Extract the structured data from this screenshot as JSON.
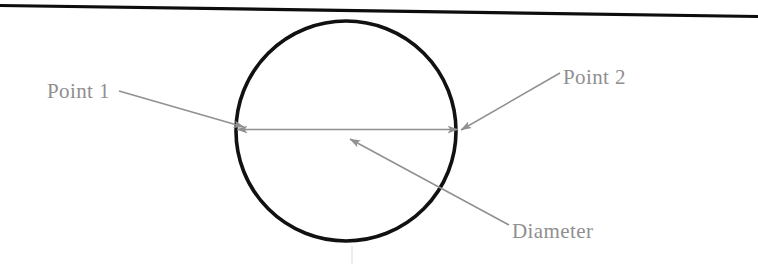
{
  "figure": {
    "kind": "technical-line-drawing",
    "width": 758,
    "height": 264,
    "background_color": "#ffffff"
  },
  "colors": {
    "outline": "#0d0d0d",
    "annotation": "#8c8c8c",
    "annotation_text": "#8f8f8f",
    "faint_guide": "#e6e6e6"
  },
  "shapes": {
    "top_rule": {
      "name": "top-border-line",
      "x1": 0,
      "y1": 5.5,
      "x2": 758,
      "y2": 16.5,
      "stroke_width": 3.2,
      "color": "#0d0d0d"
    },
    "circle": {
      "name": "circle-outline",
      "cx": 346,
      "cy": 131,
      "r": 110,
      "stroke_width": 3.6,
      "color": "#111111"
    },
    "faint_vertical": {
      "name": "faint-vertical-guide",
      "x": 352,
      "y1": 246,
      "y2": 264,
      "stroke_width": 2,
      "color": "#ededed"
    }
  },
  "arrows": {
    "diameter_measure": {
      "name": "diameter-double-arrow",
      "x1": 237,
      "y1": 129.5,
      "x2": 458,
      "y2": 129.5,
      "double_headed": true,
      "stroke_width": 1.6,
      "color": "#909090"
    },
    "point1_leader": {
      "name": "point-1-leader",
      "x1": 119,
      "y1": 91,
      "x2": 244,
      "y2": 127,
      "stroke_width": 1.5,
      "color": "#909090"
    },
    "point2_leader": {
      "name": "point-2-leader",
      "x1": 560,
      "y1": 73,
      "x2": 461,
      "y2": 130,
      "stroke_width": 1.5,
      "color": "#909090"
    },
    "diameter_leader": {
      "name": "diameter-leader",
      "x1": 509,
      "y1": 225,
      "x2": 350,
      "y2": 139,
      "stroke_width": 1.5,
      "color": "#909090"
    }
  },
  "labels": [
    {
      "id": "point-1",
      "text": "Point 1",
      "x": 47,
      "y": 79,
      "font_size": 21,
      "color": "#8f8f8f"
    },
    {
      "id": "point-2",
      "text": "Point 2",
      "x": 563,
      "y": 65,
      "font_size": 21,
      "color": "#8f8f8f"
    },
    {
      "id": "diameter",
      "text": "Diameter",
      "x": 512,
      "y": 219,
      "font_size": 21,
      "color": "#8f8f8f"
    }
  ]
}
